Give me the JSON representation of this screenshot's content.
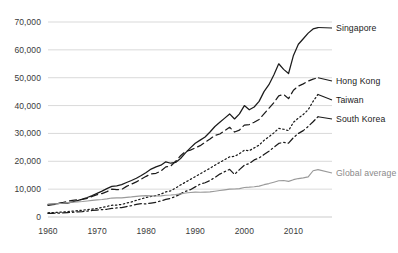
{
  "chart_data": {
    "type": "line",
    "title": "",
    "xlabel": "",
    "ylabel": "",
    "xlim": [
      1960,
      2015
    ],
    "ylim": [
      0,
      75000
    ],
    "grid": true,
    "legend_position": "right-inline-labels",
    "x_ticks": [
      "1960",
      "1970",
      "1980",
      "1990",
      "2000",
      "2010"
    ],
    "x_tick_values": [
      1960,
      1970,
      1980,
      1990,
      2000,
      2010
    ],
    "y_ticks": [
      "0",
      "10,000",
      "20,000",
      "30,000",
      "40,000",
      "50,000",
      "60,000",
      "70,000"
    ],
    "y_tick_values": [
      0,
      10000,
      20000,
      30000,
      40000,
      50000,
      60000,
      70000
    ],
    "x": [
      1960,
      1961,
      1962,
      1963,
      1964,
      1965,
      1966,
      1967,
      1968,
      1969,
      1970,
      1971,
      1972,
      1973,
      1974,
      1975,
      1976,
      1977,
      1978,
      1979,
      1980,
      1981,
      1982,
      1983,
      1984,
      1985,
      1986,
      1987,
      1988,
      1989,
      1990,
      1991,
      1992,
      1993,
      1994,
      1995,
      1996,
      1997,
      1998,
      1999,
      2000,
      2001,
      2002,
      2003,
      2004,
      2005,
      2006,
      2007,
      2008,
      2009,
      2010,
      2011,
      2012,
      2013,
      2014,
      2015
    ],
    "series": [
      {
        "name": "Singapore",
        "style": "solid",
        "color": "#1b1b1b",
        "label_color": "#1b1b1b",
        "end_value": 68000,
        "values": [
          4400,
          4600,
          4800,
          5100,
          5000,
          5400,
          5900,
          6400,
          7000,
          7700,
          8500,
          9300,
          10200,
          11000,
          11200,
          11600,
          12400,
          13100,
          13900,
          14900,
          16000,
          17200,
          18000,
          18600,
          19800,
          19300,
          19600,
          21000,
          23000,
          24800,
          26500,
          27600,
          28700,
          30500,
          32500,
          34000,
          35500,
          37000,
          35200,
          37000,
          40000,
          38500,
          39500,
          41500,
          45000,
          47500,
          51000,
          55000,
          53000,
          51500,
          58000,
          62000,
          64000,
          66000,
          67500,
          68000
        ]
      },
      {
        "name": "Hong Kong",
        "style": "dashed",
        "color": "#1b1b1b",
        "label_color": "#1b1b1b",
        "end_value": 50000,
        "values": [
          4200,
          4400,
          4800,
          5200,
          5600,
          6000,
          6200,
          6300,
          6700,
          7400,
          8000,
          8400,
          9100,
          10000,
          9800,
          9900,
          11000,
          11800,
          12600,
          13600,
          14600,
          15500,
          15700,
          16500,
          18000,
          18300,
          20000,
          22000,
          23500,
          24000,
          24800,
          25600,
          26800,
          28000,
          29300,
          29800,
          31000,
          32200,
          30500,
          31200,
          33000,
          33200,
          34000,
          35000,
          37000,
          39000,
          41000,
          43500,
          44000,
          42500,
          45500,
          47000,
          47800,
          48800,
          49500,
          50000
        ]
      },
      {
        "name": "Taiwan",
        "style": "dotted",
        "color": "#1b1b1b",
        "label_color": "#1b1b1b",
        "end_value": 44000,
        "values": [
          1500,
          1600,
          1700,
          1800,
          1950,
          2100,
          2250,
          2450,
          2650,
          2850,
          3100,
          3400,
          3800,
          4200,
          4300,
          4500,
          5000,
          5400,
          6000,
          6500,
          7000,
          7400,
          7700,
          8200,
          9000,
          9400,
          10400,
          11500,
          12500,
          13500,
          14500,
          15500,
          16500,
          17500,
          18600,
          19600,
          20600,
          21600,
          21800,
          22700,
          24000,
          23800,
          24800,
          25800,
          27500,
          28800,
          30200,
          31800,
          31500,
          31000,
          34000,
          35500,
          36800,
          38500,
          41500,
          44000
        ]
      },
      {
        "name": "South Korea",
        "style": "dashdot",
        "color": "#1b1b1b",
        "label_color": "#1b1b1b",
        "end_value": 36000,
        "values": [
          1300,
          1330,
          1400,
          1500,
          1580,
          1680,
          1850,
          1950,
          2120,
          2350,
          2500,
          2650,
          2780,
          3100,
          3250,
          3400,
          3750,
          4100,
          4500,
          4800,
          4700,
          5000,
          5300,
          5800,
          6300,
          6700,
          7400,
          8300,
          9200,
          9800,
          10800,
          11800,
          12300,
          13100,
          14200,
          15400,
          16300,
          17100,
          15300,
          17000,
          18600,
          19200,
          20500,
          21200,
          22400,
          23600,
          25000,
          26400,
          26800,
          26500,
          28500,
          30000,
          31000,
          32500,
          34200,
          36000
        ]
      },
      {
        "name": "Global average",
        "style": "solid",
        "color": "#9a9a9a",
        "label_color": "#8a8a8a",
        "end_value": 17000,
        "values": [
          4600,
          4700,
          4800,
          4950,
          5150,
          5300,
          5450,
          5550,
          5750,
          5950,
          6150,
          6300,
          6500,
          6800,
          6850,
          6850,
          7050,
          7200,
          7400,
          7600,
          7650,
          7600,
          7550,
          7600,
          7800,
          7900,
          8050,
          8300,
          8600,
          8800,
          8950,
          8900,
          8950,
          9000,
          9250,
          9500,
          9750,
          10000,
          10050,
          10200,
          10600,
          10700,
          10850,
          11100,
          11600,
          12000,
          12500,
          13000,
          13100,
          12800,
          13400,
          13800,
          14050,
          14400,
          16600,
          17000
        ]
      }
    ]
  }
}
